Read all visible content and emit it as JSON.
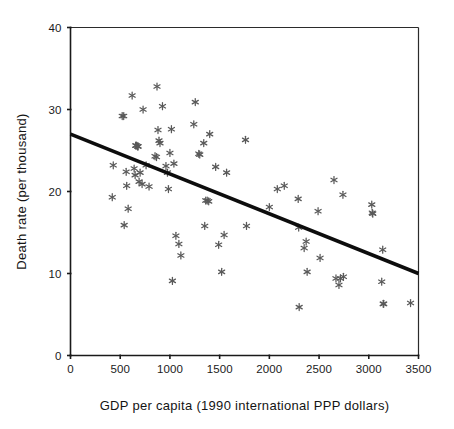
{
  "chart_data": {
    "type": "scatter",
    "title": "",
    "xlabel": "GDP per capita (1990 international PPP dollars)",
    "ylabel": "Death rate (per thousand)",
    "xlim": [
      0,
      3500
    ],
    "ylim": [
      0,
      40
    ],
    "xticks": [
      0,
      500,
      1000,
      1500,
      2000,
      2500,
      3000,
      3500
    ],
    "yticks": [
      0,
      10,
      20,
      30,
      40
    ],
    "xticklabels": [
      "0",
      "500",
      "1000",
      "1500",
      "2000",
      "2500",
      "3000",
      "3500"
    ],
    "yticklabels": [
      "0",
      "10",
      "20",
      "30",
      "40"
    ],
    "grid": false,
    "legend": false,
    "marker_symbol": "asterisk",
    "marker_color": "#595959",
    "series": [
      {
        "name": "countries",
        "points": [
          [
            420,
            19.3
          ],
          [
            430,
            23.2
          ],
          [
            520,
            29.2
          ],
          [
            535,
            29.2
          ],
          [
            540,
            15.9
          ],
          [
            560,
            22.4
          ],
          [
            565,
            20.7
          ],
          [
            580,
            17.9
          ],
          [
            620,
            31.7
          ],
          [
            640,
            22.8
          ],
          [
            650,
            22.0
          ],
          [
            655,
            25.6
          ],
          [
            665,
            25.6
          ],
          [
            675,
            25.5
          ],
          [
            680,
            25.5
          ],
          [
            690,
            21.2
          ],
          [
            700,
            22.3
          ],
          [
            720,
            20.9
          ],
          [
            730,
            30.0
          ],
          [
            760,
            23.2
          ],
          [
            790,
            20.6
          ],
          [
            850,
            24.3
          ],
          [
            865,
            24.2
          ],
          [
            870,
            32.8
          ],
          [
            880,
            27.5
          ],
          [
            890,
            26.2
          ],
          [
            900,
            25.9
          ],
          [
            925,
            30.4
          ],
          [
            960,
            23.1
          ],
          [
            975,
            22.3
          ],
          [
            985,
            20.3
          ],
          [
            1000,
            24.7
          ],
          [
            1015,
            27.6
          ],
          [
            1025,
            9.1
          ],
          [
            1040,
            23.4
          ],
          [
            1060,
            14.6
          ],
          [
            1090,
            13.6
          ],
          [
            1110,
            12.2
          ],
          [
            1240,
            28.2
          ],
          [
            1255,
            30.9
          ],
          [
            1290,
            24.6
          ],
          [
            1300,
            24.5
          ],
          [
            1340,
            25.9
          ],
          [
            1350,
            15.8
          ],
          [
            1360,
            18.9
          ],
          [
            1375,
            18.9
          ],
          [
            1390,
            18.8
          ],
          [
            1400,
            27.0
          ],
          [
            1460,
            23.0
          ],
          [
            1490,
            13.5
          ],
          [
            1520,
            10.2
          ],
          [
            1545,
            14.7
          ],
          [
            1570,
            22.3
          ],
          [
            1760,
            26.3
          ],
          [
            1770,
            15.8
          ],
          [
            2000,
            18.1
          ],
          [
            2080,
            20.3
          ],
          [
            2150,
            20.7
          ],
          [
            2290,
            19.1
          ],
          [
            2295,
            15.6
          ],
          [
            2300,
            5.9
          ],
          [
            2350,
            13.1
          ],
          [
            2370,
            13.9
          ],
          [
            2380,
            10.2
          ],
          [
            2490,
            17.6
          ],
          [
            2510,
            11.9
          ],
          [
            2650,
            21.4
          ],
          [
            2670,
            9.4
          ],
          [
            2700,
            8.6
          ],
          [
            2715,
            9.4
          ],
          [
            2740,
            19.6
          ],
          [
            2745,
            9.6
          ],
          [
            3030,
            18.4
          ],
          [
            3035,
            17.4
          ],
          [
            3040,
            17.3
          ],
          [
            3130,
            9.0
          ],
          [
            3140,
            12.9
          ],
          [
            3145,
            6.3
          ],
          [
            3150,
            6.3
          ],
          [
            3420,
            6.4
          ]
        ]
      }
    ],
    "trendline": {
      "name": "linear fit",
      "x_start": 0,
      "y_start": 27.0,
      "x_end": 3500,
      "y_end": 10.0,
      "color": "#0d0d0d"
    }
  }
}
